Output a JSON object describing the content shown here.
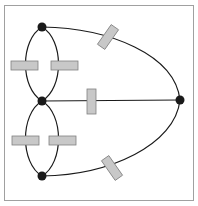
{
  "diagram": {
    "type": "circuit-graph",
    "colors": {
      "frame": "#a0a0a0",
      "wire": "#1a1a1a",
      "node": "#1a1a1a",
      "resistor_fill": "#c8c8c8",
      "resistor_stroke": "#808080"
    },
    "nodes": [
      {
        "id": "top",
        "x": 42,
        "y": 27
      },
      {
        "id": "middle",
        "x": 42,
        "y": 101
      },
      {
        "id": "bottom",
        "x": 42,
        "y": 176
      },
      {
        "id": "right",
        "x": 180,
        "y": 100
      }
    ],
    "edges": [
      {
        "from": "top",
        "to": "middle",
        "side": "left",
        "resistor": true
      },
      {
        "from": "top",
        "to": "middle",
        "side": "right",
        "resistor": true
      },
      {
        "from": "middle",
        "to": "bottom",
        "side": "left",
        "resistor": true
      },
      {
        "from": "middle",
        "to": "bottom",
        "side": "right",
        "resistor": true
      },
      {
        "from": "middle",
        "to": "right",
        "side": "straight",
        "resistor": true
      },
      {
        "from": "top",
        "to": "right",
        "side": "arc",
        "resistor": true
      },
      {
        "from": "bottom",
        "to": "right",
        "side": "arc",
        "resistor": true
      }
    ]
  }
}
